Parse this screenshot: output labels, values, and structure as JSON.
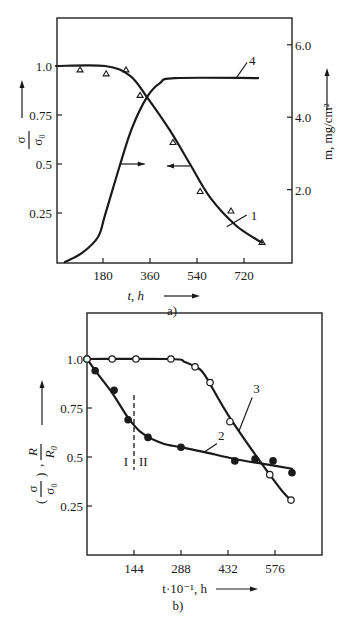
{
  "chart_data": [
    {
      "id": "a",
      "type": "line",
      "panel_label": "a)",
      "xlabel": "t, h",
      "ylabel_left": "σ/σ₀",
      "ylabel_right": "m, mg/cm²",
      "x_ticks": [
        180,
        360,
        540,
        720
      ],
      "y_left_ticks": [
        0.25,
        0.5,
        0.75,
        1.0
      ],
      "y_left_tick_labels": [
        "0.25",
        "0.5",
        "0.75",
        "1.0"
      ],
      "y_right_ticks": [
        2.0,
        4.0,
        6.0
      ],
      "y_right_tick_labels": [
        "2.0",
        "4.0",
        "6.0"
      ],
      "xlim": [
        0,
        920
      ],
      "ylim_left": [
        0,
        1.24
      ],
      "ylim_right": [
        0,
        6.6
      ],
      "grid": false,
      "series": [
        {
          "name": "1",
          "axis": "left",
          "marker": "triangle",
          "curve_x": [
            0,
            188,
            284,
            349,
            437,
            513,
            590,
            686,
            762,
            789
          ],
          "curve_y": [
            1.0,
            1.0,
            0.95,
            0.84,
            0.67,
            0.5,
            0.33,
            0.19,
            0.12,
            0.1
          ],
          "points_x": [
            92,
            192,
            268,
            322,
            448,
            552,
            670,
            789
          ],
          "points_y": [
            0.98,
            0.96,
            0.98,
            0.85,
            0.61,
            0.36,
            0.26,
            0.1
          ],
          "label_at": [
            700,
            0.26
          ]
        },
        {
          "name": "4",
          "axis": "right",
          "marker": "none",
          "curve_x": [
            34,
            100,
            161,
            188,
            245,
            291,
            349,
            398,
            456,
            774
          ],
          "curve_y": [
            0.0,
            0.25,
            0.69,
            1.3,
            2.68,
            3.7,
            4.56,
            4.94,
            5.08,
            5.08
          ],
          "label_at": [
            724,
            5.4
          ]
        }
      ],
      "arrows": [
        {
          "direction": "right",
          "points_to": "left-axis curve 4 side",
          "x_from": 245,
          "x_to": 340,
          "y": 0.5
        },
        {
          "direction": "left",
          "points_to": "curve 1 uses left axis",
          "x_from": 513,
          "x_to": 425,
          "y": 0.49
        }
      ]
    },
    {
      "id": "b",
      "type": "line",
      "panel_label": "b)",
      "xlabel": "t·10⁻¹, h",
      "ylabel": "(σ/σ₀), R/R₀",
      "x_ticks": [
        144,
        288,
        432,
        576
      ],
      "y_ticks": [
        0.25,
        0.5,
        0.75,
        1.0
      ],
      "y_tick_labels": [
        "0.25",
        "0.5",
        "0.75",
        "1.0"
      ],
      "xlim": [
        0,
        720
      ],
      "ylim": [
        0,
        1.24
      ],
      "grid": false,
      "region_divider": {
        "x": 144,
        "labels": [
          "I",
          "II"
        ],
        "style": "dashed"
      },
      "series": [
        {
          "name": "2",
          "marker": "filled-circle",
          "curve_x": [
            0,
            30,
            80,
            126,
            170,
            230,
            288,
            360,
            453,
            540,
            628
          ],
          "curve_y": [
            1.0,
            0.93,
            0.82,
            0.7,
            0.62,
            0.57,
            0.55,
            0.525,
            0.49,
            0.465,
            0.44
          ],
          "points_x": [
            0,
            25,
            83,
            126,
            187,
            288,
            453,
            515,
            570,
            628
          ],
          "points_y": [
            1.0,
            0.94,
            0.84,
            0.69,
            0.6,
            0.55,
            0.48,
            0.49,
            0.48,
            0.42
          ],
          "label_at": [
            392,
            0.61
          ]
        },
        {
          "name": "3",
          "marker": "open-circle",
          "curve_x": [
            0,
            257,
            300,
            331,
            360,
            438,
            582,
            625
          ],
          "curve_y": [
            1.0,
            1.0,
            0.985,
            0.96,
            0.92,
            0.7,
            0.36,
            0.28
          ],
          "points_x": [
            0,
            77,
            150,
            257,
            331,
            377,
            438,
            560,
            625
          ],
          "points_y": [
            1.0,
            1.0,
            1.0,
            1.0,
            0.96,
            0.88,
            0.68,
            0.41,
            0.28
          ],
          "label_at": [
            500,
            0.85
          ]
        }
      ]
    }
  ]
}
